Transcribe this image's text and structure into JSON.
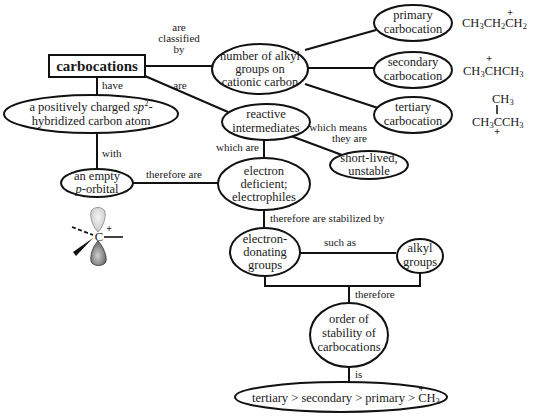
{
  "diagram": {
    "root": {
      "label": "carbocations"
    },
    "nodes": {
      "sp2_atom": {
        "line1_prefix": "a positively charged ",
        "line1_italic": "sp",
        "line1_sup": "2",
        "line1_suffix": "-",
        "line2": "hybridized carbon atom"
      },
      "alkyl_number": {
        "lines": [
          "number of alkyl",
          "groups on",
          "cationic carbon"
        ]
      },
      "reactive": {
        "lines": [
          "reactive",
          "intermediates"
        ]
      },
      "primary": {
        "lines": [
          "primary",
          "carbocation"
        ]
      },
      "secondary": {
        "lines": [
          "secondary",
          "carbocation"
        ]
      },
      "tertiary": {
        "lines": [
          "tertiary",
          "carbocation"
        ]
      },
      "empty_p": {
        "line1": "an empty",
        "line2_italic": "p",
        "line2_rest": "-orbital"
      },
      "electron_deficient": {
        "lines": [
          "electron",
          "deficient;",
          "electrophiles"
        ]
      },
      "short_lived": {
        "lines": [
          "short-lived,",
          "unstable"
        ]
      },
      "donating": {
        "lines": [
          "electron-",
          "donating",
          "groups"
        ]
      },
      "alkyl_groups": {
        "lines": [
          "alkyl",
          "groups"
        ]
      },
      "order": {
        "lines": [
          "order of",
          "stability of",
          "carbocations"
        ]
      },
      "ranking": {
        "text": "tertiary > secondary > primary > CH",
        "sub": "3",
        "charge": "+"
      }
    },
    "links": {
      "classified_by": [
        "are",
        "classified",
        "by"
      ],
      "are": "are",
      "have": "have",
      "with": "with",
      "which_are": "which are",
      "which_means": [
        "which means",
        "they are"
      ],
      "therefore_are": "therefore are",
      "stabilized_by": "therefore are stabilized by",
      "such_as": "such as",
      "therefore": "therefore",
      "is": "is"
    },
    "formulas": {
      "primary": {
        "parts": [
          "CH",
          "3",
          "CH",
          "2",
          "CH",
          "2"
        ],
        "charge": "+"
      },
      "secondary": {
        "parts": [
          "CH",
          "3",
          "CHCH",
          "3"
        ],
        "charge": "+"
      },
      "tertiary": {
        "top": "CH",
        "top_sub": "3",
        "bottom": [
          "CH",
          "3",
          "CCH",
          "3"
        ],
        "charge": "+"
      }
    },
    "orbital": {
      "atom": "C",
      "charge": "+"
    }
  }
}
